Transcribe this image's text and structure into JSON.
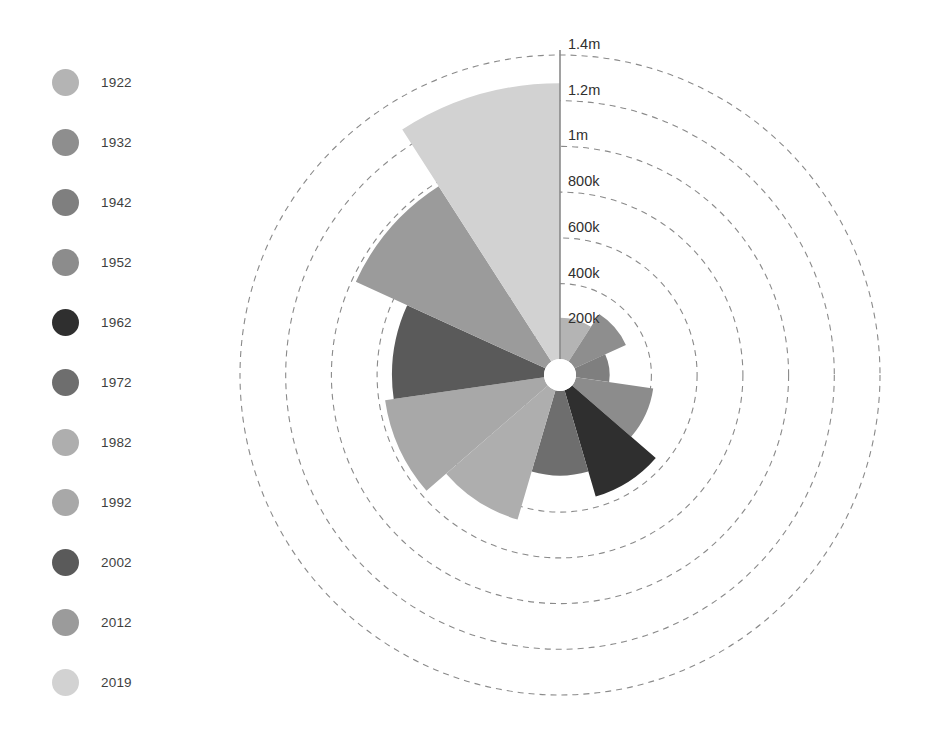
{
  "chart_data": {
    "type": "pie",
    "variant": "polar-area-rose",
    "title": "",
    "subtitle": "",
    "xlabel": "",
    "ylabel": "",
    "grid": true,
    "grid_style": "dashed-concentric-circles",
    "legend_position": "left",
    "start_angle_deg": 0,
    "direction": "clockwise",
    "center": {
      "x": 560,
      "y": 375
    },
    "max_radius_px": 320,
    "inner_hole_radius_px": 16,
    "rlim": [
      0,
      1400000
    ],
    "radial_ticks": [
      {
        "value": 200000,
        "label": "200k",
        "radius_px": 45.7
      },
      {
        "value": 400000,
        "label": "400k",
        "radius_px": 91.4
      },
      {
        "value": 600000,
        "label": "600k",
        "radius_px": 137.1
      },
      {
        "value": 800000,
        "label": "800k",
        "radius_px": 182.9
      },
      {
        "value": 1000000,
        "label": "1m",
        "radius_px": 228.6
      },
      {
        "value": 1200000,
        "label": "1.2m",
        "radius_px": 274.3
      },
      {
        "value": 1400000,
        "label": "1.4m",
        "radius_px": 320.0
      }
    ],
    "categories": [
      "1922",
      "1932",
      "1942",
      "1952",
      "1962",
      "1972",
      "1982",
      "1992",
      "2002",
      "2012",
      "2019"
    ],
    "values": [
      190000,
      260000,
      155000,
      360000,
      510000,
      390000,
      620000,
      740000,
      700000,
      960000,
      1270000
    ],
    "colors": [
      "#b4b4b4",
      "#8e8e8e",
      "#7f7f7f",
      "#8c8c8c",
      "#2f2f2f",
      "#6e6e6e",
      "#aeaeae",
      "#a8a8a8",
      "#5a5a5a",
      "#9b9b9b",
      "#d2d2d2"
    ],
    "slices": [
      {
        "label": "1922",
        "value": 190000,
        "color": "#b4b4b4",
        "start_deg": 0,
        "end_deg": 32.73
      },
      {
        "label": "1932",
        "value": 260000,
        "color": "#8e8e8e",
        "start_deg": 32.73,
        "end_deg": 65.45
      },
      {
        "label": "1942",
        "value": 155000,
        "color": "#7f7f7f",
        "start_deg": 65.45,
        "end_deg": 98.18
      },
      {
        "label": "1952",
        "value": 360000,
        "color": "#8c8c8c",
        "start_deg": 98.18,
        "end_deg": 130.91
      },
      {
        "label": "1962",
        "value": 510000,
        "color": "#2f2f2f",
        "start_deg": 130.91,
        "end_deg": 163.64
      },
      {
        "label": "1972",
        "value": 390000,
        "color": "#6e6e6e",
        "start_deg": 163.64,
        "end_deg": 196.36
      },
      {
        "label": "1982",
        "value": 620000,
        "color": "#aeaeae",
        "start_deg": 196.36,
        "end_deg": 229.09
      },
      {
        "label": "1992",
        "value": 740000,
        "color": "#a8a8a8",
        "start_deg": 229.09,
        "end_deg": 261.82
      },
      {
        "label": "2002",
        "value": 700000,
        "color": "#5a5a5a",
        "start_deg": 261.82,
        "end_deg": 294.55
      },
      {
        "label": "2012",
        "value": 960000,
        "color": "#9b9b9b",
        "start_deg": 294.55,
        "end_deg": 327.27
      },
      {
        "label": "2019",
        "value": 1270000,
        "color": "#d2d2d2",
        "start_deg": 327.27,
        "end_deg": 360.0
      }
    ]
  },
  "legend": {
    "items": [
      {
        "label": "1922",
        "color": "#b4b4b4"
      },
      {
        "label": "1932",
        "color": "#8e8e8e"
      },
      {
        "label": "1942",
        "color": "#7f7f7f"
      },
      {
        "label": "1952",
        "color": "#8c8c8c"
      },
      {
        "label": "1962",
        "color": "#2f2f2f"
      },
      {
        "label": "1972",
        "color": "#6e6e6e"
      },
      {
        "label": "1982",
        "color": "#aeaeae"
      },
      {
        "label": "1992",
        "color": "#a8a8a8"
      },
      {
        "label": "2002",
        "color": "#5a5a5a"
      },
      {
        "label": "2012",
        "color": "#9b9b9b"
      },
      {
        "label": "2019",
        "color": "#d2d2d2"
      }
    ]
  },
  "axis": {
    "grid_color": "#8a8a8a",
    "axis_line_color": "#8a8a8a",
    "label_color": "#2f2f2f"
  }
}
